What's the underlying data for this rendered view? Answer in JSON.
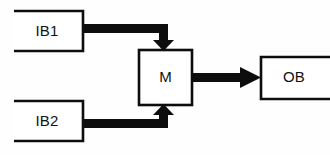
{
  "diagram": {
    "type": "block-diagram",
    "background_color": "#fefefe",
    "stroke_color": "#0d0d0d",
    "fill_color": "#ffffff",
    "nodes": [
      {
        "id": "ib1",
        "label": "IB1",
        "shape": "open-rectangle",
        "open_side": "left",
        "x": 14,
        "y": 10,
        "width": 70,
        "height": 42
      },
      {
        "id": "ib2",
        "label": "IB2",
        "shape": "open-rectangle",
        "open_side": "left",
        "x": 14,
        "y": 100,
        "width": 70,
        "height": 42
      },
      {
        "id": "m",
        "label": "M",
        "shape": "rectangle",
        "open_side": "none",
        "x": 139,
        "y": 50,
        "width": 53,
        "height": 55
      },
      {
        "id": "ob",
        "label": "OB",
        "shape": "open-rectangle",
        "open_side": "right",
        "x": 261,
        "y": 56,
        "width": 66,
        "height": 44
      }
    ],
    "edges": [
      {
        "id": "edge-ib1-m",
        "from": "ib1",
        "to": "m",
        "label": "",
        "routing": "right-then-down",
        "arrowhead": "down",
        "target_side": "top"
      },
      {
        "id": "edge-ib2-m",
        "from": "ib2",
        "to": "m",
        "label": "",
        "routing": "right-then-up",
        "arrowhead": "up",
        "target_side": "bottom"
      },
      {
        "id": "edge-m-ob",
        "from": "m",
        "to": "ob",
        "label": "",
        "routing": "straight-right",
        "arrowhead": "right",
        "target_side": "left"
      }
    ]
  }
}
